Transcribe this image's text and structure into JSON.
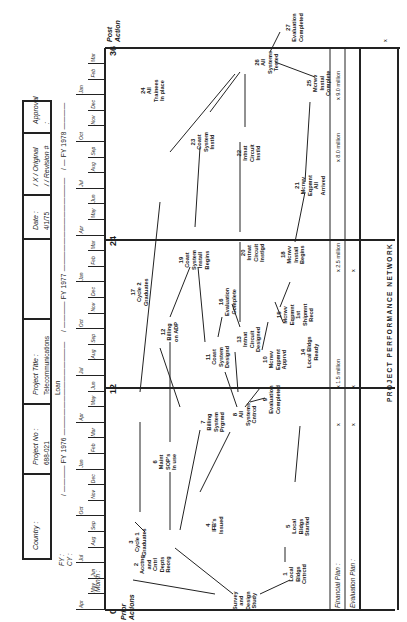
{
  "header": {
    "country_label": "Country :",
    "country_value": "",
    "project_no_label": "Project No :",
    "project_no_value": "688-021",
    "project_title_label": "Project Title :",
    "project_title_value": "Telecommunications Loan",
    "date_label": "Date :",
    "date_value": "4/1/75",
    "original_label": "/ X /  Original",
    "revision_label": "/   /  Revision #",
    "approval_label": "Approval :"
  },
  "timeline": {
    "fy_label": "FY :",
    "cy_label": "CY :",
    "month_label": "Month :",
    "fy_segments": [
      {
        "label": "/ ———— FY 1976 ——————————————"
      },
      {
        "label": "/ ———— FY 1977 ——————————————"
      },
      {
        "label": "/ — FY 1978 ————"
      }
    ],
    "months": [
      "Apr",
      "May",
      "Jun",
      "Jul",
      "Aug",
      "Sep",
      "Oct",
      "Nov",
      "Dec",
      "Jan",
      "Feb",
      "Mar",
      "Apr",
      "May",
      "Jun",
      "Jul",
      "Aug",
      "Sep",
      "Oct",
      "Nov",
      "Dec",
      "Jan",
      "Feb",
      "Mar",
      "Apr",
      "May",
      "Jun",
      "Jul",
      "Aug",
      "Sep",
      "Oct",
      "Nov",
      "Dec",
      "Jan",
      "Feb",
      "Mar"
    ]
  },
  "axis": {
    "marks": [
      "0",
      "12",
      "24",
      "36"
    ],
    "prior_label": "Prior\nActions",
    "post_label": "Post\nAction"
  },
  "nodes": [
    {
      "id": "0",
      "num": "",
      "text": "Survey\nand\nDesign\nStudy"
    },
    {
      "id": "1",
      "num": "1",
      "text": "Local\nBldgs\nCntrctd"
    },
    {
      "id": "2",
      "num": "2",
      "text": "Acctng\nand\nCntrl\nDepts\nReorg"
    },
    {
      "id": "3",
      "num": "3",
      "text": "Cycle 1\nGraduates"
    },
    {
      "id": "4",
      "num": "4",
      "text": "IFB's\nIssued"
    },
    {
      "id": "5",
      "num": "5",
      "text": "Local\nBldgs\nStarted"
    },
    {
      "id": "6",
      "num": "6",
      "text": "Maint\nSOP's\nIn use"
    },
    {
      "id": "7",
      "num": "7",
      "text": "Billing\nSystem\nPrgrmd"
    },
    {
      "id": "8",
      "num": "8",
      "text": "All\nSystems\nCntrcd"
    },
    {
      "id": "9",
      "num": "9",
      "text": "Evaluation\nCompleted"
    },
    {
      "id": "10",
      "num": "10",
      "text": "Mcrwv\nEqpmnt\nApprvd"
    },
    {
      "id": "11",
      "num": "11",
      "text": "Coast\nSystem\nDesignd"
    },
    {
      "id": "12",
      "num": "12",
      "text": "Billing\non ADP"
    },
    {
      "id": "13",
      "num": "13",
      "text": "Intnat\nCircuit\nDesigned"
    },
    {
      "id": "14",
      "num": "14",
      "text": "Local Bldgs\nReady"
    },
    {
      "id": "15",
      "num": "15",
      "text": "Mcrwv\nEqpmnt\n1st\nShipmnt\nRecd"
    },
    {
      "id": "16",
      "num": "16",
      "text": "Evaluation\nComplete"
    },
    {
      "id": "17",
      "num": "17",
      "text": "Cycle 2\nGraduates"
    },
    {
      "id": "18",
      "num": "18",
      "text": "Mcrwv\nInstall\nBegins"
    },
    {
      "id": "19",
      "num": "19",
      "text": "Coast\nSystem\nInstall\nBegins"
    },
    {
      "id": "20",
      "num": "20",
      "text": "Intnat\nCircuit\nInstlgd"
    },
    {
      "id": "21",
      "num": "21",
      "text": "Mcrwv\nEqpmnt\nAll\nArrived"
    },
    {
      "id": "22",
      "num": "22",
      "text": "Intnat\nCircuit\nInstld"
    },
    {
      "id": "23",
      "num": "23",
      "text": "Coast\nSystem\nInstld"
    },
    {
      "id": "24",
      "num": "24",
      "text": "All\nTrainees\nIn place"
    },
    {
      "id": "25",
      "num": "25",
      "text": "Mcrwv\nInstal\nComplete"
    },
    {
      "id": "26",
      "num": "26",
      "text": "All\nSystems\nTested"
    },
    {
      "id": "27",
      "num": "27",
      "text": "Evaluation\nCompleted"
    }
  ],
  "plans": {
    "financial_label": "Financial Plan :",
    "evaluation_label": "Evaluation Plan :",
    "financial_marks": [
      "x",
      "x  1.5 million",
      "x  2.5 million",
      "x  8.0 million",
      "x  9.0 million"
    ],
    "evaluation_marks": [
      "x",
      "x",
      "x",
      "x"
    ]
  },
  "footer": {
    "title": "PROJECT   PERFORMANCE   NETWORK"
  }
}
